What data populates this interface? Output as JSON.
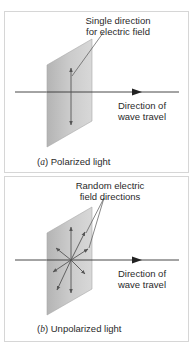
{
  "panels": [
    {
      "id": "a",
      "letter": "a",
      "caption": "Polarized light",
      "field_label_line1": "Single direction",
      "field_label_line2": "for electric field",
      "travel_label_line1": "Direction of",
      "travel_label_line2": "wave travel"
    },
    {
      "id": "b",
      "letter": "b",
      "caption": "Unpolarized light",
      "field_label_line1": "Random electric",
      "field_label_line2": "field directions",
      "travel_label_line1": "Direction of",
      "travel_label_line2": "wave travel"
    }
  ],
  "colors": {
    "plane_fill": "#bdbdbd",
    "plane_edge": "#a8a8a8",
    "arrow": "#555555",
    "axis": "#333333",
    "border": "#d6d6d6",
    "text": "#2a2a2a"
  }
}
